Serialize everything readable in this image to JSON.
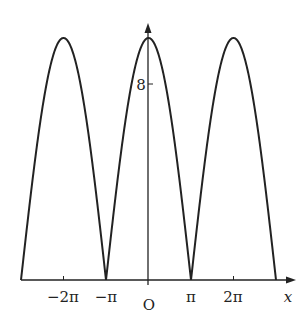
{
  "chart_data": {
    "type": "line",
    "title": "",
    "function": "y = 10|cos(x/2)|",
    "xlabel": "x",
    "ylabel": "",
    "origin_label": "O",
    "x_range": [
      -9.42,
      9.42
    ],
    "y_range": [
      0,
      10
    ],
    "x_ticks": [
      {
        "value": -6.2832,
        "label": "−2π"
      },
      {
        "value": -3.1416,
        "label": "−π"
      },
      {
        "value": 0,
        "label": "O"
      },
      {
        "value": 3.1416,
        "label": "π"
      },
      {
        "value": 6.2832,
        "label": "2π"
      }
    ],
    "y_ticks": [
      {
        "value": 8,
        "label": "8"
      }
    ],
    "series": [
      {
        "name": "curve",
        "color": "#222222",
        "key_points": [
          {
            "x": "-3π",
            "y": 0
          },
          {
            "x": "-2π",
            "y": 10
          },
          {
            "x": "-π",
            "y": 0
          },
          {
            "x": "0",
            "y": 10
          },
          {
            "x": "π",
            "y": 0
          },
          {
            "x": "2π",
            "y": 10
          },
          {
            "x": "3π",
            "y": 0
          }
        ]
      }
    ],
    "grid": false,
    "legend": null
  },
  "labels": {
    "x_axis": "x",
    "origin": "O",
    "tick_neg2pi": "−2π",
    "tick_negpi": "−π",
    "tick_pi": "π",
    "tick_2pi": "2π",
    "y_tick_8": "8"
  }
}
